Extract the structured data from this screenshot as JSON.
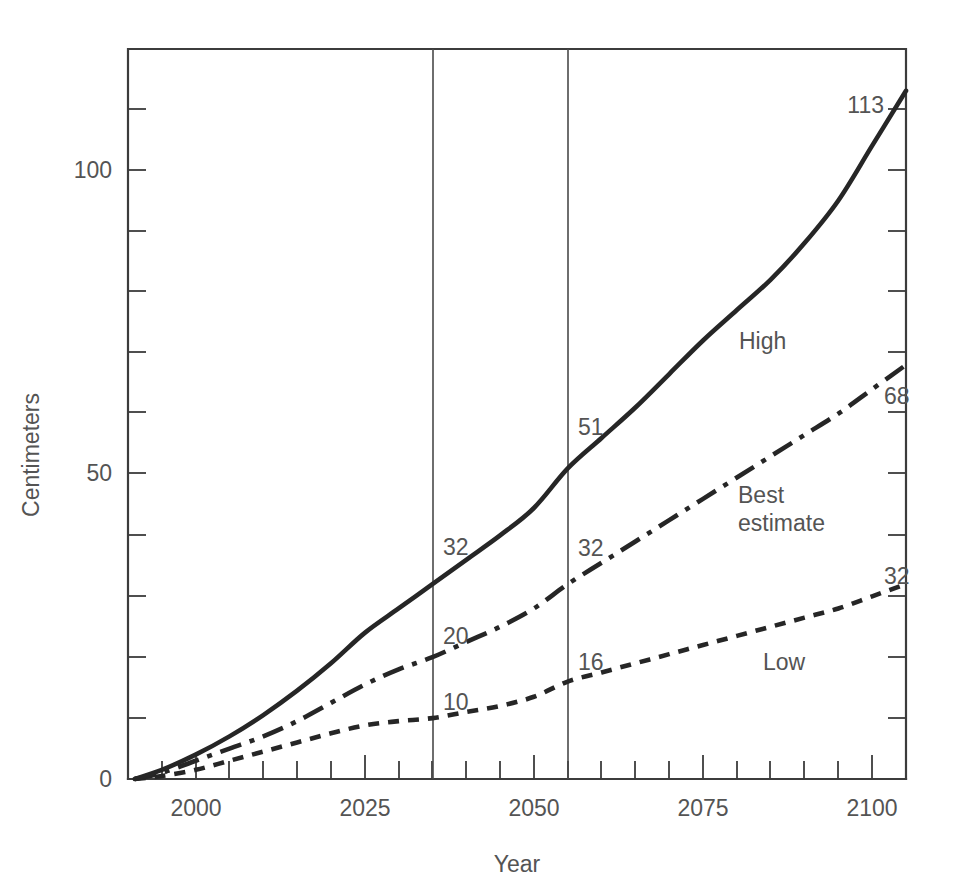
{
  "chart_data": {
    "type": "line",
    "title": "",
    "subtitle": "",
    "xlabel": "Year",
    "ylabel": "Centimeters",
    "xlim": [
      1985,
      2100
    ],
    "ylim": [
      0,
      120
    ],
    "grid": false,
    "legend_position": "inline-labels",
    "x_ticks_major": [
      2000,
      2025,
      2050,
      2075,
      2100
    ],
    "x_ticks_major_labels": [
      "2000",
      "2025",
      "2050",
      "2075",
      "2100"
    ],
    "x_tick_minor_step": 5,
    "y_ticks_major": [
      0,
      50,
      100
    ],
    "y_ticks_major_labels": [
      "0",
      "50",
      "100"
    ],
    "y_tick_minor_step": 10,
    "reference_lines": [
      {
        "name": "year-2030-line",
        "x": 2030,
        "label": ""
      },
      {
        "name": "year-2050-line",
        "x": 2050,
        "label": ""
      }
    ],
    "series": [
      {
        "name": "High",
        "label": "High",
        "style": "solid",
        "label_x": 2068,
        "label_y": 70,
        "x": [
          1986,
          1990,
          1995,
          2000,
          2005,
          2010,
          2015,
          2020,
          2025,
          2030,
          2035,
          2040,
          2045,
          2050,
          2055,
          2060,
          2065,
          2070,
          2075,
          2080,
          2085,
          2090,
          2095,
          2100
        ],
        "values": [
          0,
          1.5,
          4,
          7,
          10.5,
          14.5,
          19,
          24,
          28,
          32,
          36,
          40,
          44.5,
          51,
          56,
          61,
          66.5,
          72,
          77,
          82,
          88,
          95,
          104,
          113
        ],
        "annotations": [
          {
            "x": 2030,
            "y": 32,
            "text": "32"
          },
          {
            "x": 2050,
            "y": 51,
            "text": "51"
          },
          {
            "x": 2100,
            "y": 113,
            "text": "113"
          }
        ]
      },
      {
        "name": "Best estimate",
        "label": "Best estimate",
        "style": "dash-dot",
        "label_x": 2064,
        "label_y": 41,
        "x": [
          1986,
          1990,
          1995,
          2000,
          2005,
          2010,
          2015,
          2020,
          2025,
          2030,
          2035,
          2040,
          2045,
          2050,
          2055,
          2060,
          2065,
          2070,
          2075,
          2080,
          2085,
          2090,
          2095,
          2100
        ],
        "values": [
          0,
          1,
          3,
          5,
          7,
          9.5,
          12.5,
          15.5,
          18,
          20,
          22.5,
          25,
          28,
          32,
          35.5,
          39,
          42.5,
          46,
          49.5,
          53,
          56.5,
          60,
          64,
          68
        ],
        "annotations": [
          {
            "x": 2030,
            "y": 20,
            "text": "20"
          },
          {
            "x": 2050,
            "y": 32,
            "text": "32"
          },
          {
            "x": 2100,
            "y": 68,
            "text": "68"
          }
        ]
      },
      {
        "name": "Low",
        "label": "Low",
        "style": "dashed",
        "label_x": 2075,
        "label_y": 20,
        "x": [
          1986,
          1990,
          1995,
          2000,
          2005,
          2010,
          2015,
          2020,
          2025,
          2030,
          2035,
          2040,
          2045,
          2050,
          2055,
          2060,
          2065,
          2070,
          2075,
          2080,
          2085,
          2090,
          2095,
          2100
        ],
        "values": [
          0,
          0.5,
          1.5,
          3,
          4.5,
          6,
          7.5,
          8.8,
          9.5,
          10,
          11,
          12,
          13.5,
          16,
          17.5,
          19,
          20.5,
          22,
          23.5,
          25,
          26.5,
          28,
          30,
          32
        ],
        "annotations": [
          {
            "x": 2030,
            "y": 10,
            "text": "10"
          },
          {
            "x": 2050,
            "y": 16,
            "text": "16"
          },
          {
            "x": 2100,
            "y": 32,
            "text": "32"
          }
        ]
      }
    ]
  },
  "axes": {
    "y_title": "Centimeters",
    "x_title": "Year",
    "y_labels": [
      "100",
      "50",
      "0"
    ],
    "x_labels": [
      "2000",
      "2025",
      "2050",
      "2075",
      "2100"
    ]
  },
  "labels": {
    "high": "High",
    "best_estimate_line1": "Best",
    "best_estimate_line2": "estimate",
    "low": "Low",
    "high_2030": "32",
    "high_2050": "51",
    "high_2100": "113",
    "best_2030": "20",
    "best_2050": "32",
    "best_2100": "68",
    "low_2030": "10",
    "low_2050": "16",
    "low_2100": "32"
  },
  "colors": {
    "background": "#ffffff",
    "ink": "#262626",
    "axis": "#3c3c3c",
    "text": "#545454"
  }
}
